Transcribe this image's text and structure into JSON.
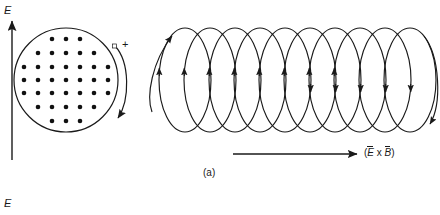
{
  "figure": {
    "caption": "(a)",
    "width": 440,
    "height": 215,
    "stroke_color": "#1a1a1a",
    "background_color": "#ffffff"
  },
  "labels": {
    "e_field_top": "E",
    "e_field_bottom": "E",
    "polarity_plus": "+",
    "propagation": {
      "open_paren": "(",
      "e_vector": "E",
      "cross": " x ",
      "b_vector": "B",
      "close_paren": ")"
    }
  },
  "e_field_arrow": {
    "name": "upward-electric-field-arrow",
    "x": 12,
    "y_start": 160,
    "y_end": 20,
    "direction": "up"
  },
  "charge_disk": {
    "name": "electric-field-out-of-page-disk",
    "center_x": 66,
    "center_y": 80,
    "radius": 52,
    "dot_radius": 2.3,
    "dot_rows": [
      3,
      5,
      7,
      7,
      7,
      5,
      3
    ],
    "dot_count": 37,
    "field_direction": "out-of-page"
  },
  "circulating_arrow": {
    "name": "magnetic-field-circulation-arrow",
    "direction": "clockwise",
    "label": "+"
  },
  "helix": {
    "name": "magnetic-field-loop-helix",
    "loop_count": 10,
    "first_loop_center_x": 185,
    "loop_spacing": 25,
    "loop_rx": 26,
    "loop_ry": 52,
    "center_y": 80,
    "top_y": 28,
    "bottom_y": 132
  },
  "propagation_arrow": {
    "name": "wave-propagation-direction-arrow",
    "x_start": 233,
    "x_end": 358,
    "y": 154,
    "direction": "right"
  }
}
